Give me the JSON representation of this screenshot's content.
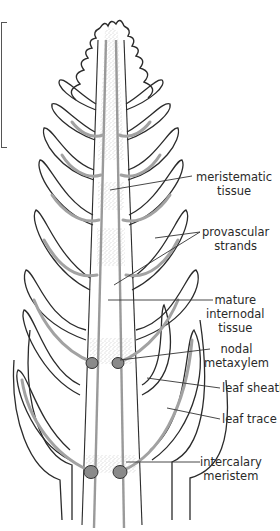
{
  "diagram": {
    "colors": {
      "outline": "#2b2b2b",
      "vascular": "#9a9a9a",
      "stipple": "#8c8c8c",
      "metaxylem_fill": "#8a8a8a",
      "label_text": "#2a2a2a"
    },
    "labels": [
      {
        "id": "meristematic-tissue",
        "lines": [
          "meristematic",
          "tissue"
        ]
      },
      {
        "id": "provascular-strands",
        "lines": [
          "provascular",
          "strands"
        ]
      },
      {
        "id": "mature-internodal-tissue",
        "lines": [
          "mature",
          "internodal",
          "tissue"
        ]
      },
      {
        "id": "nodal-metaxylem",
        "lines": [
          "nodal",
          "metaxylem"
        ]
      },
      {
        "id": "leaf-sheath",
        "lines": [
          "leaf sheath"
        ]
      },
      {
        "id": "leaf-trace",
        "lines": [
          "leaf trace"
        ]
      },
      {
        "id": "intercalary-meristem",
        "lines": [
          "intercalary",
          "meristem"
        ]
      }
    ]
  }
}
